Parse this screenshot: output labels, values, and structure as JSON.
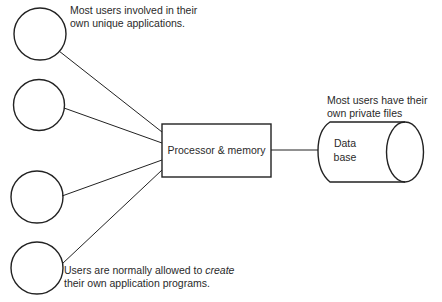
{
  "diagram": {
    "type": "architecture",
    "users": [
      {
        "id": "user-1",
        "cx": 40,
        "cy": 34,
        "r": 26
      },
      {
        "id": "user-2",
        "cx": 39,
        "cy": 105,
        "r": 25
      },
      {
        "id": "user-3",
        "cx": 37,
        "cy": 197,
        "r": 26
      },
      {
        "id": "user-4",
        "cx": 37,
        "cy": 268,
        "r": 26
      }
    ],
    "processor": {
      "label": "Processor & memory"
    },
    "database": {
      "line1": "Data",
      "line2": "base"
    },
    "annotations": {
      "top_users": {
        "line1": "Most users involved in their",
        "line2": "own unique applications."
      },
      "database_note": {
        "line1": "Most users have their",
        "line2": "own private files"
      },
      "bottom_users": {
        "line1_prefix": "Users are normally allowed to ",
        "line1_emphasis": "create",
        "line2": "their own application programs."
      }
    },
    "colors": {
      "stroke": "#222222",
      "background": "#ffffff",
      "text": "#2a2a2a"
    }
  }
}
